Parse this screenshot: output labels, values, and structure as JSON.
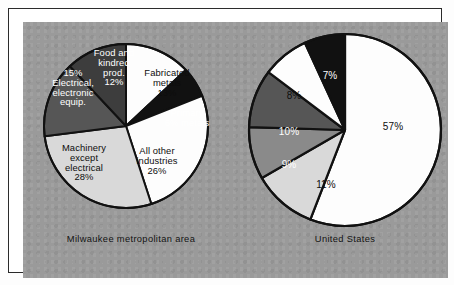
{
  "figure": {
    "background_color": "#9a9a9a",
    "frame_color": "#2a2a2a"
  },
  "palette": {
    "white": "#fdfdfd",
    "light_gray": "#d9d9d9",
    "medium_gray": "#8a8a8a",
    "dark_gray": "#565656",
    "darker_gray": "#3d3d3d",
    "black": "#111111",
    "outline": "#111111"
  },
  "chart_data": [
    {
      "type": "pie",
      "title": "Milwaukee metropolitan area",
      "caption": "Milwaukee metropolitan area",
      "start_angle_deg": 0,
      "direction": "clockwise",
      "unit": "percent",
      "categories": [
        "Fabricated metals",
        "Primary metals",
        "All other industries",
        "Machinery except electrical",
        "Electrical, electronic equip.",
        "Food and kindred prod."
      ],
      "values": [
        13,
        6,
        26,
        28,
        15,
        12
      ],
      "slices": [
        {
          "name": "Fabricated metals",
          "value": 13,
          "value_label": "13%",
          "label_lines": "Fabricated\nmetals\n13%",
          "fill": "#fdfdfd",
          "text_color": "#0d0d0d"
        },
        {
          "name": "Primary metals",
          "value": 6,
          "value_label": "6%",
          "label_lines": "Primary\n6%  metals",
          "fill": "#111111",
          "text_color": "#ffffff"
        },
        {
          "name": "All other industries",
          "value": 26,
          "value_label": "26%",
          "label_lines": "All other\nindustries\n26%",
          "fill": "#fdfdfd",
          "text_color": "#0d0d0d"
        },
        {
          "name": "Machinery except electrical",
          "value": 28,
          "value_label": "28%",
          "label_lines": "Machinery\nexcept\nelectrical\n28%",
          "fill": "#d9d9d9",
          "text_color": "#0d0d0d"
        },
        {
          "name": "Electrical, electronic equip.",
          "value": 15,
          "value_label": "15%",
          "label_lines": "15%\nElectrical,\nelectronic\nequip.",
          "fill": "#565656",
          "text_color": "#ffffff"
        },
        {
          "name": "Food and kindred prod.",
          "value": 12,
          "value_label": "12%",
          "label_lines": "Food and\nkindred\nprod.\n12%",
          "fill": "#3d3d3d",
          "text_color": "#ffffff"
        }
      ]
    },
    {
      "type": "pie",
      "title": "United States",
      "caption": "United States",
      "start_angle_deg": 0,
      "direction": "clockwise",
      "unit": "percent",
      "categories": [
        "57%",
        "11%",
        "9%",
        "10%",
        "8%",
        "7%"
      ],
      "values": [
        57,
        11,
        9,
        10,
        8,
        7
      ],
      "slices": [
        {
          "name": "all-other-industries",
          "value": 57,
          "value_label": "57%",
          "fill": "#fdfdfd",
          "text_color": "#0d0d0d"
        },
        {
          "name": "machinery-except-electrical",
          "value": 11,
          "value_label": "11%",
          "fill": "#d9d9d9",
          "text_color": "#0d0d0d"
        },
        {
          "name": "electrical-electronic-equip",
          "value": 9,
          "value_label": "9%",
          "fill": "#8a8a8a",
          "text_color": "#ffffff"
        },
        {
          "name": "food-and-kindred-prod",
          "value": 10,
          "value_label": "10%",
          "fill": "#565656",
          "text_color": "#ffffff"
        },
        {
          "name": "fabricated-metals",
          "value": 8,
          "value_label": "8%",
          "fill": "#fdfdfd",
          "text_color": "#0d0d0d"
        },
        {
          "name": "primary-metals",
          "value": 7,
          "value_label": "7%",
          "fill": "#111111",
          "text_color": "#ffffff"
        }
      ]
    }
  ]
}
